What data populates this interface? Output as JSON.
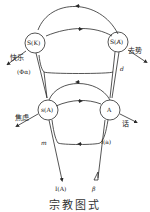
{
  "diagram": {
    "caption": "宗教图式",
    "nodes": {
      "top_left": "S(K)",
      "top_right": "S(A̸)",
      "bottom_left": "s(A)",
      "bottom_right": "A"
    },
    "labels": {
      "pleasure": "快乐",
      "castration": "去势",
      "phi_alpha": "(Φα)",
      "d": "d",
      "anxiety": "焦虑",
      "speech": "话",
      "m": "m",
      "s_a": "i(a)",
      "i_a": "I(A)",
      "beta": "β"
    },
    "colors": {
      "line": "#2a2a2a",
      "background": "#ffffff"
    }
  }
}
